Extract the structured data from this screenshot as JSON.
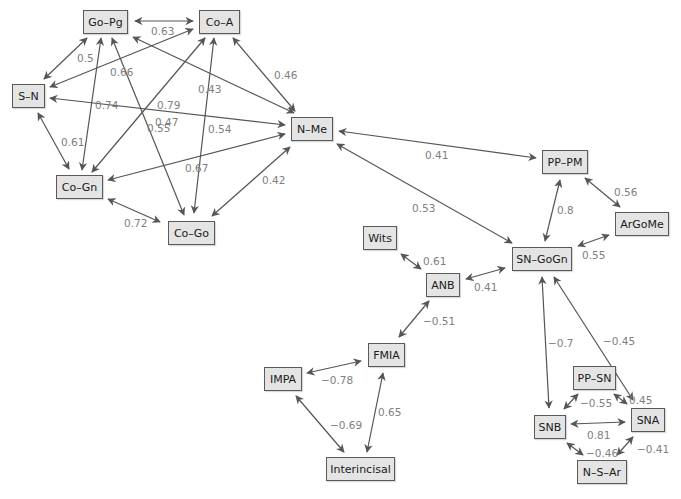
{
  "diagram": {
    "type": "correlation-network",
    "edge_color": "#555555",
    "node_fill": "#e4e4e4",
    "node_border": "#5a5a5a",
    "label_color": "#808080",
    "nodes": [
      {
        "id": "GoPg",
        "label": "Go–Pg",
        "x": 83,
        "y": 10,
        "w": 45,
        "h": 24
      },
      {
        "id": "CoA",
        "label": "Co–A",
        "x": 199,
        "y": 10,
        "w": 41,
        "h": 24
      },
      {
        "id": "SN",
        "label": "S–N",
        "x": 12,
        "y": 84,
        "w": 33,
        "h": 24
      },
      {
        "id": "NMe",
        "label": "N–Me",
        "x": 291,
        "y": 117,
        "w": 42,
        "h": 24
      },
      {
        "id": "CoGn",
        "label": "Co–Gn",
        "x": 56,
        "y": 175,
        "w": 47,
        "h": 24
      },
      {
        "id": "CoGo",
        "label": "Co–Go",
        "x": 168,
        "y": 221,
        "w": 47,
        "h": 24
      },
      {
        "id": "PPPM",
        "label": "PP–PM",
        "x": 542,
        "y": 150,
        "w": 46,
        "h": 24
      },
      {
        "id": "ArGoMe",
        "label": "ArGoMe",
        "x": 615,
        "y": 212,
        "w": 54,
        "h": 24
      },
      {
        "id": "SNGoGn",
        "label": "SN–GoGn",
        "x": 512,
        "y": 247,
        "w": 60,
        "h": 24
      },
      {
        "id": "Wits",
        "label": "Wits",
        "x": 363,
        "y": 226,
        "w": 34,
        "h": 24
      },
      {
        "id": "ANB",
        "label": "ANB",
        "x": 426,
        "y": 273,
        "w": 34,
        "h": 24
      },
      {
        "id": "FMIA",
        "label": "FMIA",
        "x": 368,
        "y": 343,
        "w": 37,
        "h": 24
      },
      {
        "id": "IMPA",
        "label": "IMPA",
        "x": 264,
        "y": 367,
        "w": 38,
        "h": 24
      },
      {
        "id": "Interincisal",
        "label": "Interincisal",
        "x": 326,
        "y": 457,
        "w": 69,
        "h": 24
      },
      {
        "id": "PPSN",
        "label": "PP–SN",
        "x": 573,
        "y": 366,
        "w": 43,
        "h": 24
      },
      {
        "id": "SNB",
        "label": "SNB",
        "x": 534,
        "y": 415,
        "w": 32,
        "h": 24
      },
      {
        "id": "SNA",
        "label": "SNA",
        "x": 631,
        "y": 408,
        "w": 34,
        "h": 24
      },
      {
        "id": "NSAr",
        "label": "N–S–Ar",
        "x": 577,
        "y": 460,
        "w": 50,
        "h": 24
      }
    ],
    "edges": [
      {
        "from": "GoPg",
        "to": "CoA",
        "value": "0.63",
        "x1": 135,
        "y1": 21,
        "x2": 193,
        "y2": 21,
        "lx": 151,
        "ly": 26
      },
      {
        "from": "GoPg",
        "to": "SN",
        "value": "0.5",
        "x1": 87,
        "y1": 38,
        "x2": 44,
        "y2": 79,
        "lx": 77,
        "ly": 53
      },
      {
        "from": "CoA",
        "to": "SN",
        "value": "0.66",
        "x1": 193,
        "y1": 29,
        "x2": 50,
        "y2": 87,
        "lx": 110,
        "ly": 67
      },
      {
        "from": "GoPg",
        "to": "NMe",
        "value": "0.79",
        "x1": 133,
        "y1": 37,
        "x2": 294,
        "y2": 113,
        "lx": 157,
        "ly": 100
      },
      {
        "from": "CoA",
        "to": "NMe",
        "value": "0.46",
        "x1": 233,
        "y1": 38,
        "x2": 295,
        "y2": 111,
        "lx": 274,
        "ly": 70
      },
      {
        "from": "SN",
        "to": "NMe",
        "value": "0.74",
        "x1": 50,
        "y1": 98,
        "x2": 285,
        "y2": 125,
        "lx": 95,
        "ly": 100
      },
      {
        "from": "GoPg",
        "to": "CoGn",
        "value": "0.55",
        "x1": 101,
        "y1": 38,
        "x2": 82,
        "y2": 170,
        "lx": 147,
        "ly": 123
      },
      {
        "from": "GoPg",
        "to": "CoGo",
        "value": "0.47",
        "x1": 112,
        "y1": 38,
        "x2": 184,
        "y2": 215,
        "lx": 155,
        "ly": 117
      },
      {
        "from": "CoA",
        "to": "CoGn",
        "value": "0.43",
        "x1": 205,
        "y1": 38,
        "x2": 92,
        "y2": 172,
        "lx": 198,
        "ly": 84
      },
      {
        "from": "CoA",
        "to": "CoGo",
        "value": "0.54",
        "x1": 214,
        "y1": 38,
        "x2": 194,
        "y2": 213,
        "lx": 208,
        "ly": 124
      },
      {
        "from": "SN",
        "to": "CoGn",
        "value": "0.61",
        "x1": 38,
        "y1": 113,
        "x2": 69,
        "y2": 169,
        "lx": 61,
        "ly": 137
      },
      {
        "from": "CoGn",
        "to": "NMe",
        "value": "0.67",
        "x1": 108,
        "y1": 180,
        "x2": 285,
        "y2": 134,
        "lx": 185,
        "ly": 163
      },
      {
        "from": "CoGn",
        "to": "CoGo",
        "value": "0.72",
        "x1": 108,
        "y1": 199,
        "x2": 160,
        "y2": 222,
        "lx": 124,
        "ly": 218
      },
      {
        "from": "CoGo",
        "to": "NMe",
        "value": "0.42",
        "x1": 212,
        "y1": 216,
        "x2": 290,
        "y2": 147,
        "lx": 262,
        "ly": 175
      },
      {
        "from": "NMe",
        "to": "PPPM",
        "value": "0.41",
        "x1": 339,
        "y1": 131,
        "x2": 536,
        "y2": 158,
        "lx": 425,
        "ly": 150
      },
      {
        "from": "NMe",
        "to": "SNGoGn",
        "value": "0.53",
        "x1": 337,
        "y1": 144,
        "x2": 512,
        "y2": 243,
        "lx": 412,
        "ly": 203
      },
      {
        "from": "PPPM",
        "to": "SNGoGn",
        "value": "0.8",
        "x1": 560,
        "y1": 180,
        "x2": 545,
        "y2": 241,
        "lx": 557,
        "ly": 205
      },
      {
        "from": "PPPM",
        "to": "ArGoMe",
        "value": "0.56",
        "x1": 585,
        "y1": 178,
        "x2": 620,
        "y2": 207,
        "lx": 614,
        "ly": 187
      },
      {
        "from": "ArGoMe",
        "to": "SNGoGn",
        "value": "0.55",
        "x1": 609,
        "y1": 235,
        "x2": 578,
        "y2": 246,
        "lx": 582,
        "ly": 250
      },
      {
        "from": "Wits",
        "to": "ANB",
        "value": "0.61",
        "x1": 401,
        "y1": 254,
        "x2": 421,
        "y2": 269,
        "lx": 423,
        "ly": 256
      },
      {
        "from": "ANB",
        "to": "SNGoGn",
        "value": "0.41",
        "x1": 466,
        "y1": 279,
        "x2": 505,
        "y2": 268,
        "lx": 474,
        "ly": 282
      },
      {
        "from": "ANB",
        "to": "FMIA",
        "value": "−0.51",
        "x1": 429,
        "y1": 301,
        "x2": 399,
        "y2": 337,
        "lx": 423,
        "ly": 316
      },
      {
        "from": "IMPA",
        "to": "FMIA",
        "value": "−0.78",
        "x1": 307,
        "y1": 373,
        "x2": 361,
        "y2": 361,
        "lx": 321,
        "ly": 375
      },
      {
        "from": "IMPA",
        "to": "Interincisal",
        "value": "−0.69",
        "x1": 296,
        "y1": 396,
        "x2": 344,
        "y2": 452,
        "lx": 330,
        "ly": 420
      },
      {
        "from": "FMIA",
        "to": "Interincisal",
        "value": "0.65",
        "x1": 383,
        "y1": 373,
        "x2": 367,
        "y2": 452,
        "lx": 378,
        "ly": 407
      },
      {
        "from": "SNGoGn",
        "to": "SNB",
        "value": "−0.7",
        "x1": 542,
        "y1": 277,
        "x2": 549,
        "y2": 408,
        "lx": 548,
        "ly": 338
      },
      {
        "from": "SNGoGn",
        "to": "SNA",
        "value": "−0.45",
        "x1": 554,
        "y1": 277,
        "x2": 633,
        "y2": 400,
        "lx": 603,
        "ly": 336
      },
      {
        "from": "PPSN",
        "to": "SNB",
        "value": "−0.55",
        "x1": 578,
        "y1": 394,
        "x2": 564,
        "y2": 409,
        "lx": 580,
        "ly": 398
      },
      {
        "from": "PPSN",
        "to": "SNA",
        "value": "0.45",
        "x1": 614,
        "y1": 394,
        "x2": 627,
        "y2": 404,
        "lx": 629,
        "ly": 395
      },
      {
        "from": "SNB",
        "to": "SNA",
        "value": "0.81",
        "x1": 571,
        "y1": 424,
        "x2": 625,
        "y2": 422,
        "lx": 587,
        "ly": 430
      },
      {
        "from": "SNB",
        "to": "NSAr",
        "value": "−0.46",
        "x1": 567,
        "y1": 443,
        "x2": 583,
        "y2": 455,
        "lx": 586,
        "ly": 448
      },
      {
        "from": "SNA",
        "to": "NSAr",
        "value": "−0.41",
        "x1": 633,
        "y1": 437,
        "x2": 617,
        "y2": 455,
        "lx": 637,
        "ly": 444
      }
    ]
  }
}
